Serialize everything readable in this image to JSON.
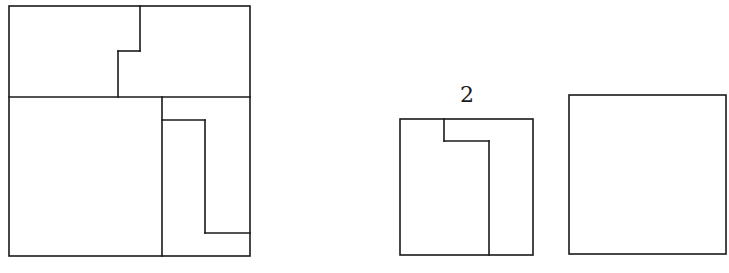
{
  "figures": [
    {
      "id": "composite-square",
      "description": "Large square divided into regions by stepped lines",
      "outer": {
        "x": 9,
        "y": 6,
        "w": 241,
        "h": 250
      },
      "segments": [
        {
          "x1": 9,
          "y1": 97,
          "x2": 250,
          "y2": 97
        },
        {
          "x1": 140,
          "y1": 6,
          "x2": 140,
          "y2": 51
        },
        {
          "x1": 118,
          "y1": 51,
          "x2": 140,
          "y2": 51
        },
        {
          "x1": 118,
          "y1": 51,
          "x2": 118,
          "y2": 97
        },
        {
          "x1": 162,
          "y1": 97,
          "x2": 162,
          "y2": 256
        },
        {
          "x1": 162,
          "y1": 120,
          "x2": 205,
          "y2": 120
        },
        {
          "x1": 205,
          "y1": 120,
          "x2": 205,
          "y2": 233
        },
        {
          "x1": 205,
          "y1": 233,
          "x2": 250,
          "y2": 233
        }
      ]
    },
    {
      "id": "piece-2",
      "label": "2",
      "label_pos": {
        "x": 467,
        "y": 84
      },
      "outer": {
        "x": 400,
        "y": 119,
        "w": 133,
        "h": 136
      },
      "segments": [
        {
          "x1": 444,
          "y1": 119,
          "x2": 444,
          "y2": 141
        },
        {
          "x1": 444,
          "y1": 141,
          "x2": 489,
          "y2": 141
        },
        {
          "x1": 489,
          "y1": 141,
          "x2": 489,
          "y2": 255
        }
      ]
    },
    {
      "id": "empty-square",
      "outer": {
        "x": 569,
        "y": 95,
        "w": 157,
        "h": 159
      },
      "segments": []
    }
  ],
  "colors": {
    "stroke": "#1a1a1a",
    "background": "#ffffff"
  }
}
